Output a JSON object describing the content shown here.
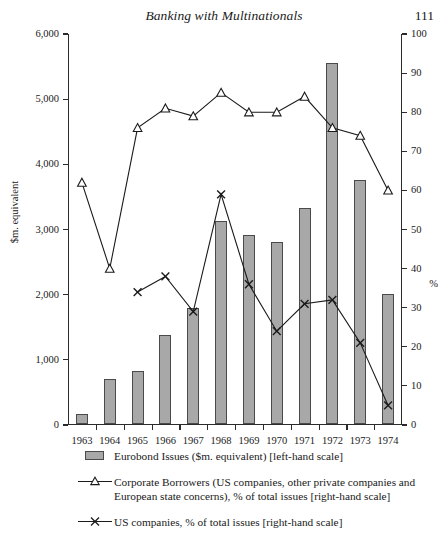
{
  "runhead": {
    "title": "Banking with Multinationals",
    "page_number": "111"
  },
  "chart_data": {
    "type": "bar",
    "title": "",
    "subtitle": "",
    "xlabel": "",
    "ylabel": "$m. equivalent",
    "y2label": "%",
    "grid": false,
    "legend_position": "bottom",
    "categories": [
      "1963",
      "1964",
      "1965",
      "1966",
      "1967",
      "1968",
      "1969",
      "1970",
      "1971",
      "1972",
      "1973",
      "1974"
    ],
    "ylim": [
      0,
      6000
    ],
    "y2lim": [
      0,
      100
    ],
    "yticks": [
      "0",
      "1,000",
      "2,000",
      "3,000",
      "4,000",
      "5,000",
      "6,000"
    ],
    "ytick_values": [
      0,
      1000,
      2000,
      3000,
      4000,
      5000,
      6000
    ],
    "y2ticks": [
      "0",
      "10",
      "20",
      "30",
      "40",
      "50",
      "60",
      "70",
      "80",
      "90",
      "100"
    ],
    "y2tick_values": [
      0,
      10,
      20,
      30,
      40,
      50,
      60,
      70,
      80,
      90,
      100
    ],
    "series": [
      {
        "name": "Eurobond Issues ($m. equivalent) [left-hand scale]",
        "type": "bar",
        "axis": "left",
        "marker": "square-swatch",
        "color": "#a8a8a8",
        "edge": "#4a4a4a",
        "values": [
          148,
          680,
          810,
          1355,
          1780,
          3105,
          2900,
          2790,
          3305,
          5540,
          3735,
          1985
        ]
      },
      {
        "name": "Corporate Borrowers (US companies, other private companies and European state concerns), % of total issues [right-hand scale]",
        "type": "line",
        "axis": "right",
        "marker": "triangle",
        "color": "#1a1a1a",
        "values": [
          62,
          40,
          76,
          81,
          79,
          85,
          80,
          80,
          84,
          76,
          74,
          60
        ]
      },
      {
        "name": "US companies, % of total issues [right-hand scale]",
        "type": "line",
        "axis": "right",
        "marker": "x",
        "color": "#1a1a1a",
        "values": [
          null,
          null,
          34,
          38,
          29,
          59,
          36,
          24,
          31,
          32,
          21,
          5
        ]
      }
    ]
  },
  "legend": {
    "items": [
      {
        "marker": "square-swatch",
        "label": "Eurobond Issues ($m. equivalent) [left-hand scale]"
      },
      {
        "marker": "triangle",
        "label": "Corporate Borrowers (US companies, other private companies and European state concerns), % of total issues [right-hand scale]"
      },
      {
        "marker": "x",
        "label": "US companies, % of total issues [right-hand scale]"
      }
    ]
  }
}
